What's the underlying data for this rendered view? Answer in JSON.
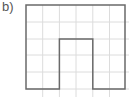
{
  "label": "b)",
  "grid": {
    "origin_x": 26,
    "origin_y": 5,
    "cell": 16.7,
    "cols": 6,
    "rows": 5,
    "color": "#dcdcdc"
  },
  "shape": {
    "description": "Arch / U-shape outline on grid",
    "stroke": "#6a6a6a",
    "points_grid": [
      [
        0,
        0
      ],
      [
        6,
        0
      ],
      [
        6,
        5
      ],
      [
        4,
        5
      ],
      [
        4,
        2
      ],
      [
        2,
        2
      ],
      [
        2,
        5
      ],
      [
        0,
        5
      ]
    ]
  }
}
